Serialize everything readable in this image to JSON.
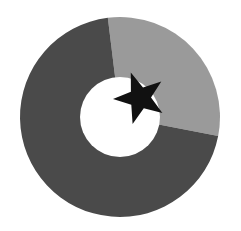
{
  "chart_data": {
    "type": "pie",
    "variant": "donut",
    "title": "",
    "labels": [
      "Segment A",
      "Segment B"
    ],
    "values": [
      30,
      70
    ],
    "colors": [
      "#9a9a9a",
      "#4a4a4a"
    ],
    "start_angle_deg": -7,
    "center": [
      120,
      117
    ],
    "outer_radius": 100,
    "inner_radius": 40,
    "legend": "none",
    "annotations": [
      {
        "type": "star-marker",
        "color": "#111111",
        "center": [
          140,
          98
        ],
        "outer_radius": 27,
        "inner_radius": 11
      }
    ]
  },
  "colors": {
    "background": "#ffffff",
    "hole": "#ffffff",
    "star": "#111111"
  }
}
